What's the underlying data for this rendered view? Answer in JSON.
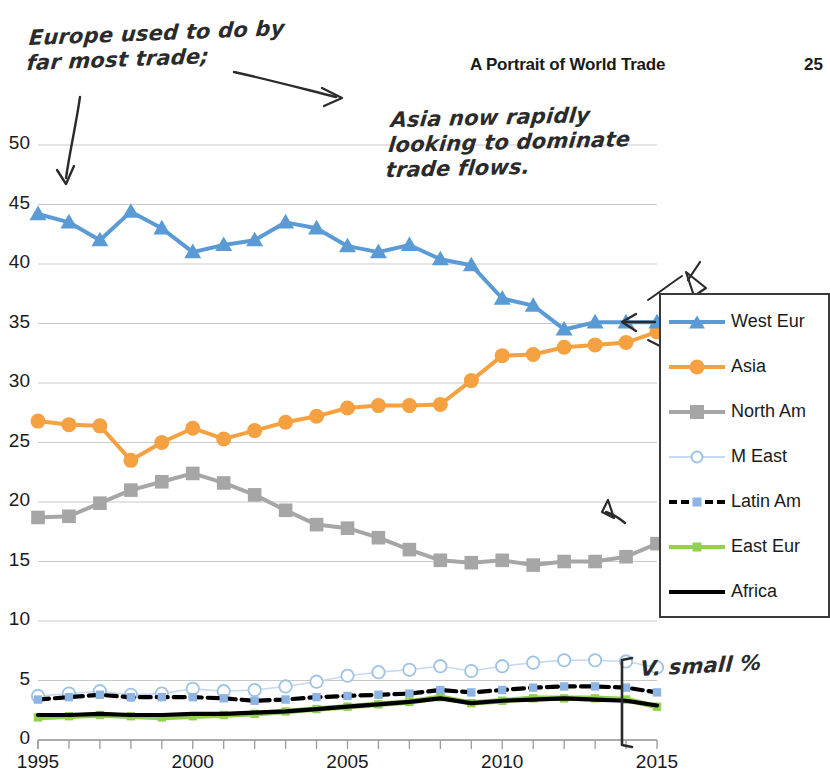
{
  "header": {
    "title": "A Portrait of World Trade",
    "page_number": "25"
  },
  "annotations": [
    {
      "id": "note-europe",
      "text": "Europe used to do by\nfar most trade;"
    },
    {
      "id": "note-asia",
      "text": "Asia now rapidly\nlooking to dominate\ntrade flows."
    },
    {
      "id": "note-vsmall",
      "text": "V. small %"
    }
  ],
  "legend": {
    "position": "right",
    "entries": [
      {
        "label": "West Eur",
        "color": "#5b9bd5",
        "marker": "triangle"
      },
      {
        "label": "Asia",
        "color": "#f5a142",
        "marker": "circle"
      },
      {
        "label": "North Am",
        "color": "#a6a6a6",
        "marker": "square"
      },
      {
        "label": "M East",
        "color": "#c5d9f1",
        "marker": "open-circle"
      },
      {
        "label": "Latin Am",
        "color": "#000000",
        "marker": "small-square",
        "marker_color": "#8db4e2",
        "dashed": true
      },
      {
        "label": "East Eur",
        "color": "#92d050",
        "marker": "small-square",
        "marker_color": "#92d050"
      },
      {
        "label": "Africa",
        "color": "#000000",
        "marker": "none"
      }
    ]
  },
  "chart_data": {
    "type": "line",
    "title": "A Portrait of World Trade",
    "xlabel": "",
    "ylabel": "",
    "xlim": [
      1995,
      2015
    ],
    "ylim": [
      0,
      50
    ],
    "ytick_step": 5,
    "yticks": [
      "0",
      "5",
      "10",
      "15",
      "20",
      "25",
      "30",
      "35",
      "40",
      "45",
      "50"
    ],
    "xticks": [
      "1995",
      "2000",
      "2005",
      "2010",
      "2015"
    ],
    "x": [
      1995,
      1996,
      1997,
      1998,
      1999,
      2000,
      2001,
      2002,
      2003,
      2004,
      2005,
      2006,
      2007,
      2008,
      2009,
      2010,
      2011,
      2012,
      2013,
      2014,
      2015
    ],
    "grid": true,
    "legend_position": "right",
    "series": [
      {
        "name": "West Eur",
        "color": "#5b9bd5",
        "marker": "triangle",
        "values": [
          44.2,
          43.5,
          42.0,
          44.4,
          43.0,
          41.0,
          41.6,
          42.0,
          43.5,
          43.0,
          41.5,
          41.0,
          41.6,
          40.4,
          39.9,
          37.1,
          36.5,
          34.5,
          35.1,
          35.1,
          35.1
        ]
      },
      {
        "name": "Asia",
        "color": "#f5a142",
        "marker": "circle",
        "values": [
          26.8,
          26.5,
          26.4,
          23.5,
          25.0,
          26.2,
          25.3,
          26.0,
          26.7,
          27.2,
          27.9,
          28.1,
          28.1,
          28.2,
          30.2,
          32.3,
          32.4,
          33.0,
          33.2,
          33.4,
          34.3
        ]
      },
      {
        "name": "North Am",
        "color": "#a6a6a6",
        "marker": "square",
        "values": [
          18.7,
          18.8,
          19.9,
          21.0,
          21.7,
          22.4,
          21.6,
          20.6,
          19.3,
          18.1,
          17.8,
          17.0,
          16.0,
          15.1,
          14.9,
          15.1,
          14.7,
          15.0,
          15.0,
          15.4,
          16.5
        ]
      },
      {
        "name": "M East",
        "color": "#c5d9f1",
        "marker": "open-circle",
        "values": [
          3.7,
          3.9,
          4.1,
          3.8,
          3.9,
          4.3,
          4.1,
          4.2,
          4.5,
          4.9,
          5.4,
          5.7,
          5.9,
          6.2,
          5.8,
          6.2,
          6.5,
          6.7,
          6.7,
          6.6,
          6.1
        ]
      },
      {
        "name": "Latin Am",
        "color": "#000000",
        "marker_color": "#8db4e2",
        "marker": "small-square",
        "dashed": true,
        "values": [
          3.4,
          3.6,
          3.8,
          3.6,
          3.6,
          3.6,
          3.5,
          3.3,
          3.4,
          3.6,
          3.7,
          3.8,
          3.9,
          4.2,
          4.0,
          4.2,
          4.4,
          4.5,
          4.5,
          4.4,
          4.0
        ]
      },
      {
        "name": "East Eur",
        "color": "#92d050",
        "marker_color": "#92d050",
        "marker": "small-square",
        "values": [
          1.9,
          2.0,
          2.1,
          2.0,
          1.9,
          2.0,
          2.1,
          2.2,
          2.4,
          2.6,
          2.8,
          3.0,
          3.2,
          3.6,
          3.1,
          3.3,
          3.5,
          3.5,
          3.5,
          3.4,
          2.8
        ]
      },
      {
        "name": "Africa",
        "color": "#000000",
        "marker": "none",
        "values": [
          2.1,
          2.1,
          2.2,
          2.1,
          2.1,
          2.2,
          2.2,
          2.3,
          2.4,
          2.6,
          2.8,
          3.0,
          3.2,
          3.5,
          3.1,
          3.3,
          3.4,
          3.5,
          3.4,
          3.3,
          2.9
        ]
      }
    ]
  }
}
